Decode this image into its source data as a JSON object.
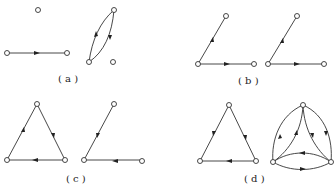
{
  "figure": {
    "panels": [
      {
        "id": "a",
        "label": "( a )"
      },
      {
        "id": "b",
        "label": "( b )"
      },
      {
        "id": "c",
        "label": "( c )"
      },
      {
        "id": "d",
        "label": "( d )"
      }
    ]
  }
}
